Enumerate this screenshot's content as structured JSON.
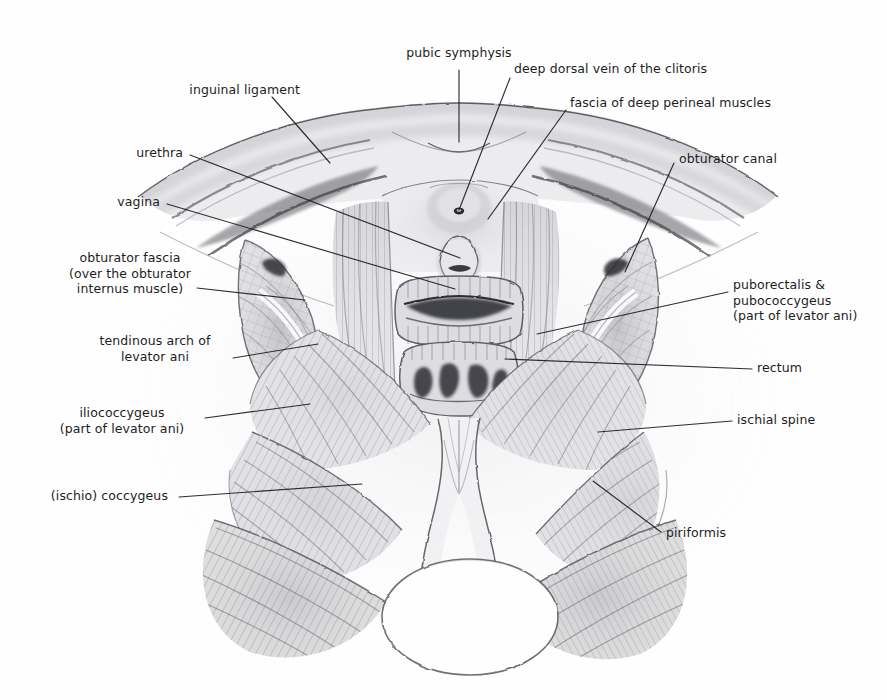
{
  "figure": {
    "style": "graphite pencil medical illustration",
    "background_color": "#ffffff",
    "ink_color": "#1d1d1d",
    "graphite_color": "#6e6e72",
    "width": 887,
    "height": 700
  },
  "labels": [
    {
      "id": "pubic-symphysis",
      "text": "pubic symphysis",
      "align": "c",
      "x": 459,
      "y": 45,
      "leader": [
        [
          459,
          70
        ],
        [
          459,
          142
        ]
      ]
    },
    {
      "id": "inguinal-ligament",
      "text": "inguinal ligament",
      "align": "r",
      "x": 300,
      "y": 82,
      "leader": [
        [
          272,
          97
        ],
        [
          330,
          163
        ]
      ]
    },
    {
      "id": "deep-dorsal-vein-of-the-clitoris",
      "text": "deep dorsal vein of the clitoris",
      "align": "l",
      "x": 514,
      "y": 61,
      "leader": [
        [
          510,
          78
        ],
        [
          459,
          210
        ]
      ]
    },
    {
      "id": "fascia-of-deep-perineal-muscles",
      "text": "fascia of deep perineal muscles",
      "align": "l",
      "x": 570,
      "y": 95,
      "leader": [
        [
          566,
          110
        ],
        [
          488,
          219
        ]
      ]
    },
    {
      "id": "obturator-canal",
      "text": "obturator canal",
      "align": "l",
      "x": 679,
      "y": 151,
      "leader": [
        [
          674,
          163
        ],
        [
          625,
          272
        ]
      ]
    },
    {
      "id": "urethra",
      "text": "urethra",
      "align": "r",
      "x": 183,
      "y": 145,
      "leader": [
        [
          190,
          155
        ],
        [
          460,
          258
        ]
      ]
    },
    {
      "id": "vagina",
      "text": "vagina",
      "align": "r",
      "x": 160,
      "y": 194,
      "leader": [
        [
          167,
          204
        ],
        [
          455,
          289
        ]
      ]
    },
    {
      "id": "obturator-fascia",
      "text": "obturator fascia\n(over the obturator\ninternus muscle)",
      "align": "c",
      "x": 130,
      "y": 250,
      "leader": [
        [
          197,
          288
        ],
        [
          305,
          300
        ]
      ]
    },
    {
      "id": "tendinous-arch-of-levator-ani",
      "text": "tendinous arch of\nlevator ani",
      "align": "c",
      "x": 155,
      "y": 333,
      "leader": [
        [
          233,
          358
        ],
        [
          318,
          344
        ]
      ]
    },
    {
      "id": "iliococcygeus",
      "text": "iliococcygeus\n(part of levator ani)",
      "align": "c",
      "x": 122,
      "y": 405,
      "leader": [
        [
          205,
          418
        ],
        [
          310,
          404
        ]
      ]
    },
    {
      "id": "ischio-coccygeus",
      "text": "(ischio) coccygeus",
      "align": "r",
      "x": 168,
      "y": 488,
      "leader": [
        [
          179,
          497
        ],
        [
          362,
          484
        ]
      ]
    },
    {
      "id": "puborectalis-pubococcygeus",
      "text": "puborectalis &\npubococcygeus\n(part of levator ani)",
      "align": "l",
      "x": 733,
      "y": 277,
      "leader": [
        [
          728,
          292
        ],
        [
          537,
          334
        ]
      ]
    },
    {
      "id": "rectum",
      "text": "rectum",
      "align": "l",
      "x": 757,
      "y": 360,
      "leader": [
        [
          752,
          369
        ],
        [
          505,
          359
        ]
      ]
    },
    {
      "id": "ischial-spine",
      "text": "ischial spine",
      "align": "l",
      "x": 737,
      "y": 412,
      "leader": [
        [
          732,
          421
        ],
        [
          598,
          432
        ]
      ]
    },
    {
      "id": "piriformis",
      "text": "piriformis",
      "align": "l",
      "x": 666,
      "y": 525,
      "leader": [
        [
          661,
          532
        ],
        [
          593,
          481
        ]
      ]
    }
  ],
  "structures": [
    {
      "id": "pubic-bone-arch",
      "name": "pubic bone and superior ramus arch"
    },
    {
      "id": "urogenital-diaphragm",
      "name": "fascia of deep perineal muscles"
    },
    {
      "id": "urethral-opening",
      "name": "urethra"
    },
    {
      "id": "vaginal-opening",
      "name": "vagina"
    },
    {
      "id": "rectal-opening",
      "name": "rectum"
    },
    {
      "id": "obturator-internus-left",
      "name": "left obturator internus with fascia"
    },
    {
      "id": "obturator-internus-right",
      "name": "right obturator internus with fascia"
    },
    {
      "id": "levator-ani-left",
      "name": "left levator ani sheet"
    },
    {
      "id": "levator-ani-right",
      "name": "right levator ani sheet"
    },
    {
      "id": "coccygeus-left",
      "name": "left (ischio) coccygeus"
    },
    {
      "id": "coccygeus-right",
      "name": "right (ischio) coccygeus"
    },
    {
      "id": "piriformis-left",
      "name": "left piriformis"
    },
    {
      "id": "piriformis-right",
      "name": "right piriformis"
    },
    {
      "id": "anococcygeal-raphe",
      "name": "anococcygeal raphe"
    },
    {
      "id": "coccyx",
      "name": "coccyx / sacrum"
    }
  ]
}
